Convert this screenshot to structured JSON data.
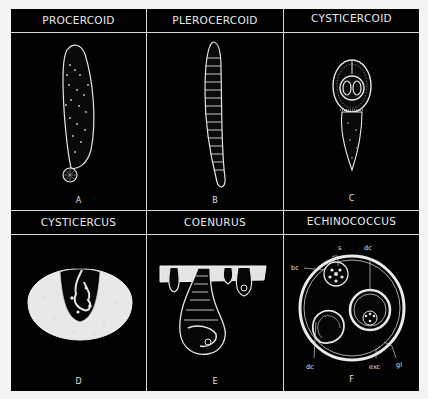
{
  "figure": {
    "panels": [
      {
        "id": "A",
        "title": "PROCERCOID",
        "letter": "A"
      },
      {
        "id": "B",
        "title": "PLEROCERCOID",
        "letter": "B"
      },
      {
        "id": "C",
        "title": "CYSTICERCOID",
        "letter": "C"
      },
      {
        "id": "D",
        "title": "CYSTICERCUS",
        "letter": "D"
      },
      {
        "id": "E",
        "title": "COENURUS",
        "letter": "E"
      },
      {
        "id": "F",
        "title": "ECHINOCOCCUS",
        "letter": "F"
      }
    ],
    "echinococcus_labels": {
      "s": "s",
      "dc_top": "dc",
      "bc": "bc",
      "dc_bottom": "dc",
      "exc": "exc",
      "gl": "gl"
    },
    "colors": {
      "background": "#020202",
      "lines": "#d8d8d8",
      "page": "#f4f4f2",
      "drawing": "#e6e6e6"
    }
  }
}
